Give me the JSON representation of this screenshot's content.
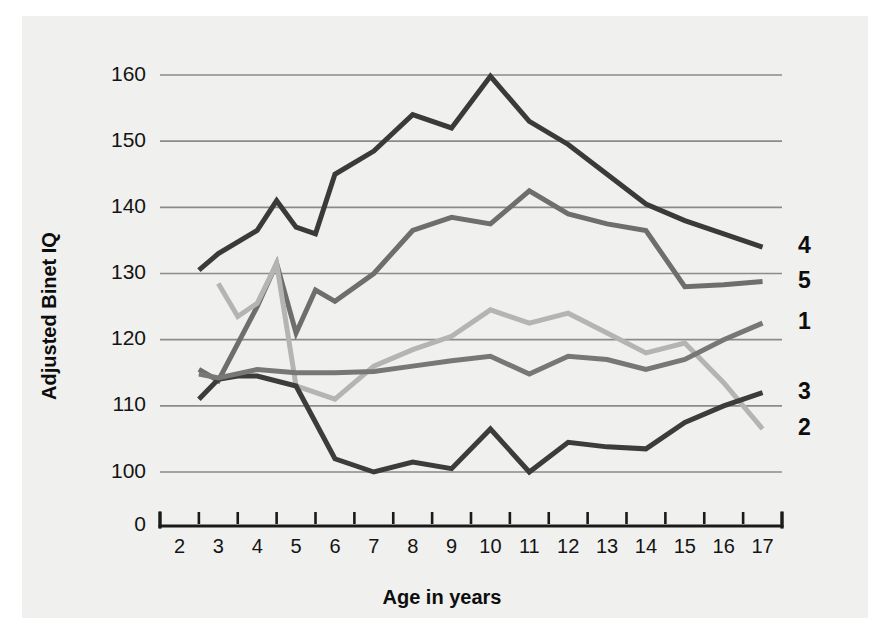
{
  "chart_data": {
    "type": "line",
    "title": "",
    "xlabel": "Age in years",
    "ylabel": "Adjusted Binet IQ",
    "xlim": [
      1.5,
      17.5
    ],
    "ylim": [
      96,
      163
    ],
    "grid": true,
    "grid_axis": "y",
    "yticks": [
      100,
      110,
      120,
      130,
      140,
      150,
      160
    ],
    "ytick_labels": [
      "100",
      "110",
      "120",
      "130",
      "140",
      "150",
      "160"
    ],
    "y_origin_label": "0",
    "xticks": [
      2,
      3,
      4,
      5,
      6,
      7,
      8,
      9,
      10,
      11,
      12,
      13,
      14,
      15,
      16,
      17
    ],
    "xtick_labels": [
      "2",
      "3",
      "4",
      "5",
      "6",
      "7",
      "8",
      "9",
      "10",
      "11",
      "12",
      "13",
      "14",
      "15",
      "16",
      "17"
    ],
    "legend_position": "right-end-of-line",
    "series": [
      {
        "name": "1",
        "label": "1",
        "color": "#6e6e6e",
        "x": [
          2.5,
          3,
          4,
          4.5,
          5,
          5.5,
          6,
          7,
          8,
          9,
          10,
          11,
          12,
          13,
          14,
          15,
          16,
          17
        ],
        "values": [
          115.5,
          113.8,
          125.0,
          131.5,
          121.0,
          127.5,
          125.8,
          130.0,
          136.5,
          138.5,
          137.5,
          142.5,
          139.0,
          137.5,
          136.5,
          128.0,
          128.3,
          128.8
        ]
      },
      {
        "name": "2",
        "label": "2",
        "color": "#b4b4b4",
        "x": [
          3,
          3.5,
          4,
          4.5,
          5,
          6,
          7,
          8,
          9,
          10,
          11,
          12,
          13,
          14,
          15,
          16,
          17
        ],
        "values": [
          128.5,
          123.5,
          125.5,
          131.5,
          113.0,
          111.0,
          116.0,
          118.5,
          120.5,
          124.5,
          122.5,
          124.0,
          121.0,
          118.0,
          119.5,
          113.5,
          106.5
        ]
      },
      {
        "name": "3",
        "label": "3",
        "color": "#3c3c3c",
        "x": [
          2.5,
          3,
          3.5,
          4,
          5,
          6,
          7,
          8,
          9,
          10,
          11,
          12,
          13,
          14,
          15,
          16,
          17
        ],
        "values": [
          111.0,
          114.0,
          114.5,
          114.5,
          113.0,
          102.0,
          100.0,
          101.5,
          100.5,
          106.5,
          100.0,
          104.5,
          103.8,
          103.5,
          107.5,
          110.0,
          112.0
        ]
      },
      {
        "name": "4",
        "label": "4",
        "color": "#3a3a3a",
        "x": [
          2.5,
          3,
          4,
          4.5,
          5,
          5.5,
          6,
          7,
          8,
          9,
          10,
          11,
          12,
          13,
          14,
          15,
          16,
          17
        ],
        "values": [
          130.5,
          133.0,
          136.5,
          141.0,
          137.0,
          136.0,
          145.0,
          148.5,
          154.0,
          152.0,
          159.8,
          153.0,
          149.5,
          145.0,
          140.5,
          138.0,
          136.0,
          134.0
        ]
      },
      {
        "name": "5",
        "label": "5",
        "color": "#777777",
        "x": [
          2.5,
          3,
          4,
          5,
          6,
          7,
          8,
          9,
          10,
          11,
          12,
          13,
          14,
          15,
          16,
          17
        ],
        "values": [
          114.8,
          114.2,
          115.5,
          115.0,
          115.0,
          115.2,
          116.0,
          116.8,
          117.5,
          114.8,
          117.5,
          117.0,
          115.5,
          117.0,
          120.0,
          122.5
        ]
      }
    ],
    "series_label_order_top_to_bottom": [
      "4",
      "5",
      "1",
      "3",
      "2"
    ],
    "series_end_labels": [
      {
        "label": "4",
        "value": 134.0
      },
      {
        "label": "5",
        "value": 128.8
      },
      {
        "label": "1",
        "value": 122.5
      },
      {
        "label": "3",
        "value": 112.0
      },
      {
        "label": "2",
        "value": 106.5
      }
    ]
  },
  "colors": {
    "background": "#ffffff",
    "plate": "#f0f0ee",
    "gridline": "#8b8b8b",
    "axis": "#1a1a1a",
    "text": "#141414"
  }
}
